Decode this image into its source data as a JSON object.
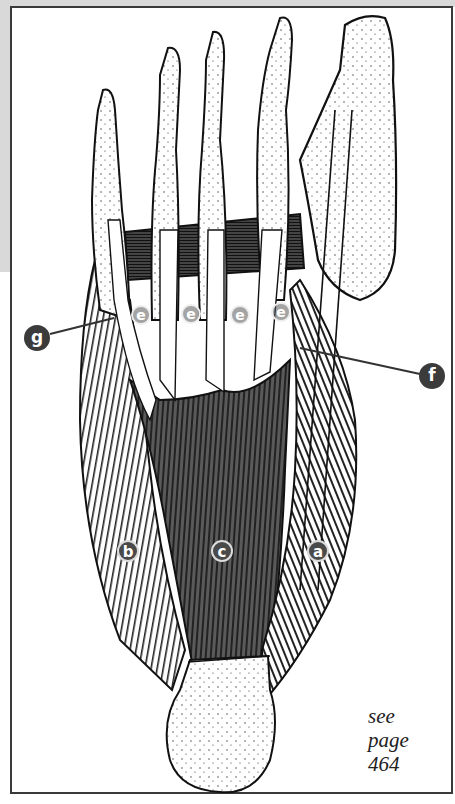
{
  "figure": {
    "labels": {
      "a": "a",
      "b": "b",
      "c": "c",
      "e": [
        "e",
        "e",
        "e",
        "e"
      ],
      "f": "f",
      "g": "g"
    },
    "reference": {
      "line1": "see",
      "line2": "page",
      "line3": "464"
    }
  },
  "colors": {
    "muscle_dark": "#3a3a3a",
    "muscle_mid": "#6a6a6a",
    "bone": "#ffffff",
    "label_fill": "#3b3b3b",
    "frame": "#3a3a3a",
    "margin_gray": "#d9d9d9"
  }
}
